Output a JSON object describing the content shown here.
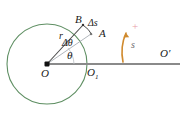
{
  "figure": {
    "colors": {
      "circle": "#5f8f63",
      "axis": "#8a8a8a",
      "radius_line": "#555555",
      "chord_line": "#9aa0a6",
      "arc_arrow": "#d08a2e",
      "plus_sign": "#e8a0a8",
      "label_text": "#1a1a1a",
      "background": "#ffffff"
    },
    "geometry": {
      "center_x": 47,
      "center_y": 64,
      "radius": 40,
      "point_B_x": 82,
      "point_B_y": 25,
      "point_A_x": 90,
      "point_A_y": 34,
      "point_O1_x": 87,
      "point_O1_y": 64,
      "axis_x_start": 47,
      "axis_x_end": 180,
      "theta_deg": 37,
      "delta_theta_deg": 11
    },
    "labels": {
      "point_b": "B",
      "delta_s": "Δs",
      "point_a": "A",
      "radius": "r",
      "delta_theta": "Δθ",
      "theta": "θ",
      "origin": "O",
      "origin_one": "O",
      "origin_one_sub": "1",
      "origin_prime": "O′",
      "arc_length": "s",
      "positive_sign": "+"
    }
  }
}
